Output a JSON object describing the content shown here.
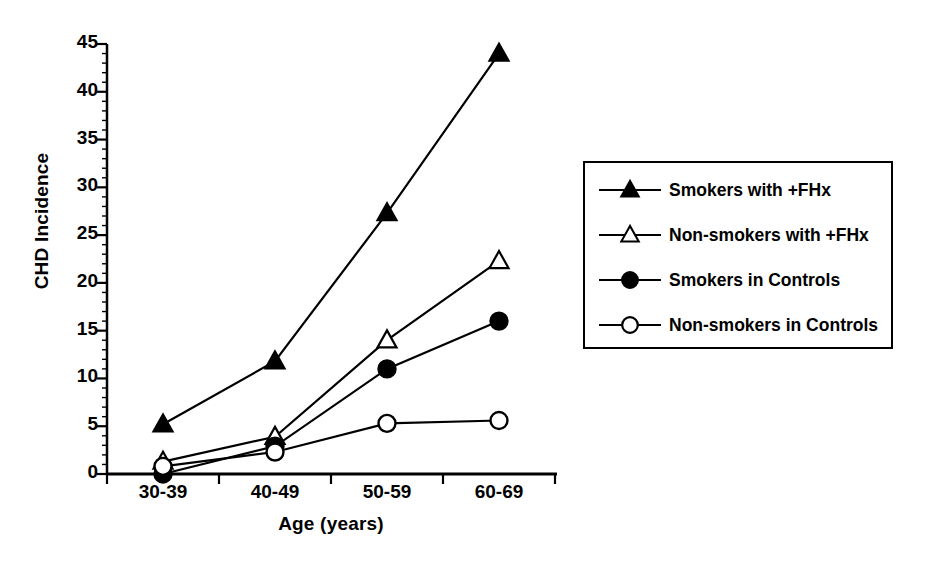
{
  "chart_data": {
    "type": "line",
    "title": "",
    "xlabel": "Age (years)",
    "ylabel": "CHD Incidence",
    "categories": [
      "30-39",
      "40-49",
      "50-59",
      "60-69"
    ],
    "ylim": [
      0,
      45
    ],
    "ytick_labels": [
      "0",
      "5",
      "10",
      "15",
      "20",
      "25",
      "30",
      "35",
      "40",
      "45"
    ],
    "ytick_values": [
      0,
      5,
      10,
      15,
      20,
      25,
      30,
      35,
      40,
      45
    ],
    "yminor_interval": 1,
    "grid": false,
    "legend_position": "right",
    "series": [
      {
        "name": "Smokers with +FHx",
        "marker": "filled-triangle",
        "color": "#000000",
        "values": [
          5.2,
          11.8,
          27.3,
          44.0
        ]
      },
      {
        "name": "Non-smokers with +FHx",
        "marker": "open-triangle",
        "color": "#000000",
        "values": [
          1.3,
          3.9,
          14.0,
          22.3
        ]
      },
      {
        "name": "Smokers in Controls",
        "marker": "filled-circle",
        "color": "#000000",
        "values": [
          0.0,
          2.9,
          11.0,
          16.0
        ]
      },
      {
        "name": "Non-smokers in Controls",
        "marker": "open-circle",
        "color": "#000000",
        "values": [
          0.8,
          2.3,
          5.3,
          5.6
        ]
      }
    ]
  }
}
